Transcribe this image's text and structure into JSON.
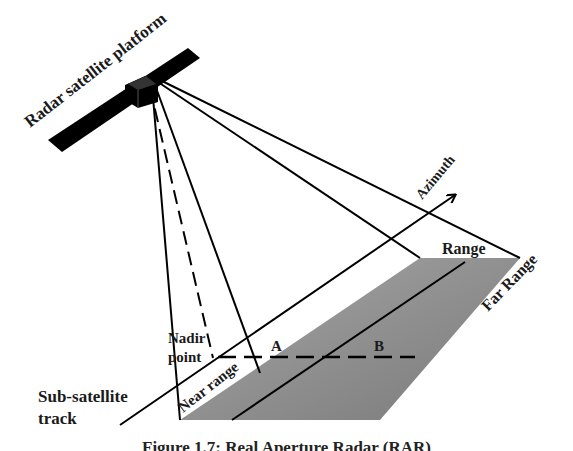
{
  "diagram": {
    "type": "radar-geometry",
    "labels": {
      "platform": "Radar satellite platform",
      "azimuth": "Azimuth",
      "range": "Range",
      "far_range": "Far Range",
      "near_range": "Near range",
      "nadir_line1": "Nadir",
      "nadir_line2": "point",
      "point_a": "A",
      "point_b": "B",
      "subtrack_line1": "Sub-satellite",
      "subtrack_line2": "track"
    },
    "caption": "Figure 1.7: Real Aperture Radar (RAR)",
    "colors": {
      "swath_fill": "#8c8c8c",
      "swath_light": "#b0b0b0",
      "line": "#000000",
      "background": "#ffffff"
    }
  }
}
